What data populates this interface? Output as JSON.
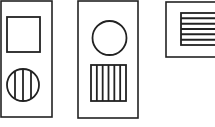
{
  "diagram": {
    "stroke_color": "#222222",
    "background": "#ffffff",
    "panels": [
      {
        "id": "panel-1",
        "frame": {
          "x": 1,
          "y": 1,
          "w": 51,
          "h": 116
        },
        "shapes": [
          {
            "type": "square",
            "fill": "none",
            "x": 7,
            "y": 17,
            "w": 33,
            "h": 35
          },
          {
            "type": "circle",
            "fill": "vertical-stripes",
            "cx": 23,
            "cy": 85,
            "r": 16,
            "stripes": 4
          }
        ]
      },
      {
        "id": "panel-2",
        "frame": {
          "x": 78,
          "y": 1,
          "w": 60,
          "h": 117
        },
        "shapes": [
          {
            "type": "circle",
            "fill": "none",
            "cx": 109.5,
            "cy": 38,
            "r": 17
          },
          {
            "type": "square",
            "fill": "vertical-stripes",
            "x": 91,
            "y": 65,
            "w": 35,
            "h": 36,
            "stripes": 6
          }
        ]
      },
      {
        "id": "panel-3",
        "frame": {
          "x": 166,
          "y": 2,
          "w": 60,
          "h": 55
        },
        "shapes": [
          {
            "type": "rectangle",
            "fill": "horizontal-stripes",
            "x": 181,
            "y": 13,
            "w": 40,
            "h": 32,
            "stripes": 6
          }
        ]
      }
    ]
  }
}
